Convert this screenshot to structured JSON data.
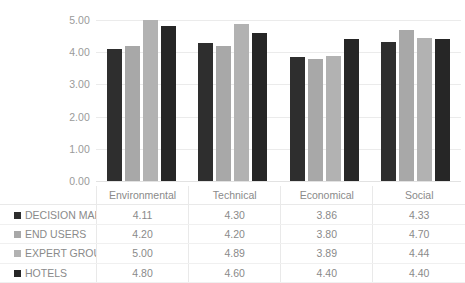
{
  "chart_data": {
    "type": "bar",
    "title": "",
    "subtitle": "",
    "xlabel": "",
    "ylabel": "",
    "ylim": [
      0,
      5
    ],
    "ytick_step": 1,
    "yticks": [
      "0.00",
      "1.00",
      "2.00",
      "3.00",
      "4.00",
      "5.00"
    ],
    "grid": true,
    "legend_position": "data-table",
    "categories": [
      "Environmental",
      "Technical",
      "Economical",
      "Social"
    ],
    "series": [
      {
        "name": "DECISION MAKERS",
        "color": "#2e2e2e",
        "values": [
          4.11,
          4.3,
          3.86,
          4.33
        ],
        "labels": [
          "4.11",
          "4.30",
          "3.86",
          "4.33"
        ]
      },
      {
        "name": "END USERS",
        "color": "#a8a8a8",
        "values": [
          4.2,
          4.2,
          3.8,
          4.7
        ],
        "labels": [
          "4.20",
          "4.20",
          "3.80",
          "4.70"
        ]
      },
      {
        "name": "EXPERT GROUP",
        "color": "#b2b2b2",
        "values": [
          5.0,
          4.89,
          3.89,
          4.44
        ],
        "labels": [
          "5.00",
          "4.89",
          "3.89",
          "4.44"
        ]
      },
      {
        "name": "HOTELS",
        "color": "#262626",
        "values": [
          4.8,
          4.6,
          4.4,
          4.4
        ],
        "labels": [
          "4.80",
          "4.60",
          "4.40",
          "4.40"
        ]
      }
    ]
  },
  "colors": {
    "background": "#ffffff",
    "gridline": "#ebebeb",
    "text": "#8a8a8a",
    "table_border": "#e9e9e9"
  }
}
